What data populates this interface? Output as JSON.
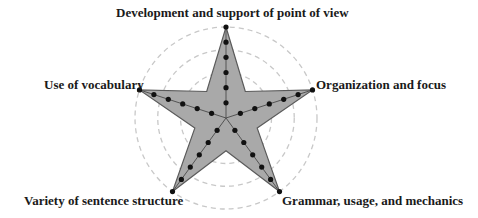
{
  "chart_data": {
    "type": "radar",
    "title": "",
    "categories": [
      "Development and support of point of view",
      "Organization and focus",
      "Grammar, usage, and mechanics",
      "Variety of sentence structure",
      "Use of vocabulary"
    ],
    "series": [
      {
        "name": "Score",
        "values": [
          6,
          6,
          6,
          6,
          6
        ]
      }
    ],
    "scale": {
      "min": 0,
      "max": 6,
      "ticks_per_axis": 6
    },
    "grid": {
      "shape": "circle",
      "style": "dashed",
      "rings": 4
    },
    "inner_notch_ratio": 0.36,
    "legend": "none"
  },
  "labels": {
    "top": "Development and support of point of view",
    "right": "Organization and focus",
    "bottom_right": "Grammar, usage, and mechanics",
    "bottom_left": "Variety of sentence structure",
    "left": "Use of vocabulary"
  },
  "colors": {
    "fill": "#a9a9a9",
    "outline": "#5a5a5a",
    "axis": "#4a4a4a",
    "marker": "#111111",
    "grid": "#c8c8c8"
  }
}
